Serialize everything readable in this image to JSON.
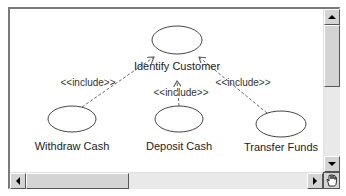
{
  "diagram": {
    "type": "uml-use-case",
    "use_cases": [
      {
        "id": "identify",
        "label": "Identify Customer",
        "cx": 167,
        "cy": 31,
        "rx": 25,
        "ry": 14
      },
      {
        "id": "withdraw",
        "label": "Withdraw Cash",
        "cx": 62,
        "cy": 110,
        "rx": 24,
        "ry": 13
      },
      {
        "id": "deposit",
        "label": "Deposit Cash",
        "cx": 169,
        "cy": 110,
        "rx": 24,
        "ry": 13
      },
      {
        "id": "transfer",
        "label": "Transfer Funds",
        "cx": 271,
        "cy": 115,
        "rx": 25,
        "ry": 13
      }
    ],
    "relationships": [
      {
        "from": "withdraw",
        "to": "identify",
        "stereotype": "<<include>>"
      },
      {
        "from": "deposit",
        "to": "identify",
        "stereotype": "<<include>>"
      },
      {
        "from": "transfer",
        "to": "identify",
        "stereotype": "<<include>>"
      }
    ]
  },
  "labels": {
    "identify": "Identify Customer",
    "withdraw": "Withdraw Cash",
    "deposit": "Deposit Cash",
    "transfer": "Transfer Funds",
    "include_left": "<<include>>",
    "include_center": "<<include>>",
    "include_right": "<<include>>"
  },
  "scrollbars": {
    "vertical": {
      "thumb_start_pct": 0,
      "thumb_size_pct": 44
    },
    "horizontal": {
      "thumb_start_pct": 0,
      "thumb_size_pct": 36
    }
  },
  "colors": {
    "line": "#555555",
    "scrollbar_bg": "#e9e9e9",
    "button_face": "#d4d4d4"
  },
  "corner_icon": "hand-cursor-icon"
}
